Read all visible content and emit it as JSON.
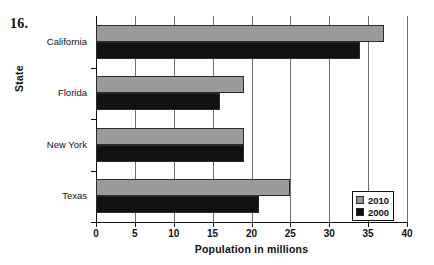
{
  "problem_number": "16.",
  "chart_data": {
    "type": "bar",
    "orientation": "horizontal",
    "title": "",
    "xlabel": "Population in millions",
    "ylabel": "State",
    "categories": [
      "California",
      "Florida",
      "New York",
      "Texas"
    ],
    "series": [
      {
        "name": "2010",
        "color": "#9a9a9a",
        "values": [
          37,
          19,
          19,
          25
        ]
      },
      {
        "name": "2000",
        "color": "#111111",
        "values": [
          34,
          16,
          19,
          21
        ]
      }
    ],
    "xlim": [
      0,
      40
    ],
    "xticks": [
      0,
      5,
      10,
      15,
      20,
      25,
      30,
      35,
      40
    ],
    "xtick_labels": [
      "0",
      "5",
      "10",
      "15",
      "20",
      "25",
      "30",
      "35",
      "40"
    ],
    "grid": "vertical",
    "legend_position": "bottom-right",
    "legend_entries": [
      "2010",
      "2000"
    ]
  }
}
